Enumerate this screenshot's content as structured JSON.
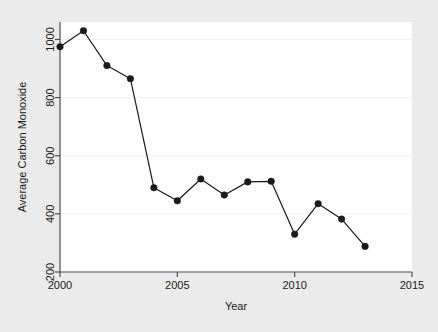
{
  "chart_data": {
    "type": "line",
    "title": "",
    "xlabel": "Year",
    "ylabel": "Average Carbon Monoxide",
    "x": [
      2000,
      2001,
      2002,
      2003,
      2004,
      2005,
      2006,
      2007,
      2008,
      2009,
      2010,
      2011,
      2012,
      2013
    ],
    "values": [
      975,
      1030,
      910,
      865,
      490,
      445,
      520,
      465,
      510,
      512,
      330,
      435,
      382,
      288
    ],
    "series": [
      {
        "name": "Average Carbon Monoxide",
        "values": [
          975,
          1030,
          910,
          865,
          490,
          445,
          520,
          465,
          510,
          512,
          330,
          435,
          382,
          288
        ]
      }
    ],
    "xlim": [
      2000,
      2015
    ],
    "ylim": [
      200,
      1060
    ],
    "xticks": [
      2000,
      2005,
      2010,
      2015
    ],
    "xtick_labels": [
      "2000",
      "2005",
      "2010",
      "2015"
    ],
    "yticks": [
      200,
      400,
      600,
      800,
      1000
    ],
    "ytick_labels": [
      "200",
      "400",
      "600",
      "800",
      "1000"
    ],
    "grid": "horizontal",
    "legend": "none",
    "marker": "filled-circle",
    "line_color": "#1a1a1a",
    "marker_color": "#1a1a1a",
    "plot_background": "#ffffff",
    "figure_background": "#ebebeb",
    "gridline_color": "#f2f2f2",
    "axis_color": "#4d4d4d"
  },
  "axes": {
    "y_title": "Average Carbon Monoxide",
    "x_title": "Year",
    "y_labels": [
      "1000",
      "800",
      "600",
      "400",
      "200"
    ],
    "x_labels": [
      "2000",
      "2005",
      "2010",
      "2015"
    ]
  }
}
